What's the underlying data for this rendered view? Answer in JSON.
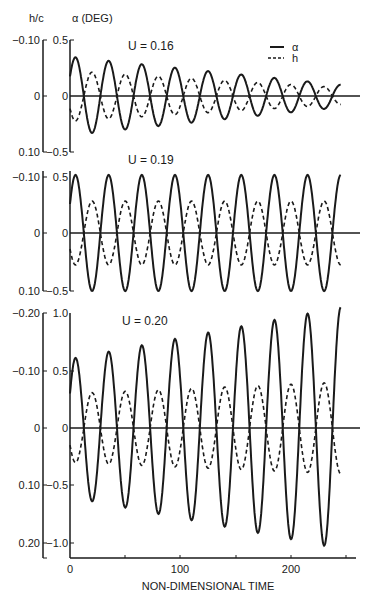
{
  "header": {
    "h_label": "h/c",
    "alpha_label": "α (DEG)"
  },
  "legend": {
    "alpha": "α",
    "h": "h"
  },
  "xaxis": {
    "title": "NON-DIMENSIONAL TIME",
    "ticks": [
      "0",
      "100",
      "200"
    ]
  },
  "panels": [
    {
      "title": "U = 0.16",
      "h_ticks": [
        "−0.10",
        "0",
        "0.10"
      ],
      "alpha_ticks": [
        "0.5",
        "0",
        "−0.5"
      ]
    },
    {
      "title": "U = 0.19",
      "h_ticks": [
        "−0.10",
        "0",
        "0.10"
      ],
      "alpha_ticks": [
        "0.5",
        "0",
        "−0.5"
      ]
    },
    {
      "title": "U = 0.20",
      "h_ticks": [
        "−0.20",
        "−0.10",
        "0",
        "0.10",
        "0.20"
      ],
      "alpha_ticks": [
        "1.0",
        "0.5",
        "0",
        "−0.5",
        "−1.0"
      ]
    }
  ],
  "chart_data": [
    {
      "type": "line",
      "title": "U = 0.16",
      "xlabel": "NON-DIMENSIONAL TIME",
      "ylabel": "α (DEG) / h/c",
      "xlim": [
        0,
        250
      ],
      "ylim_alpha": [
        -0.5,
        0.5
      ],
      "ylim_h": [
        0.1,
        -0.1
      ],
      "description": "Damped oscillation: alpha and h decay",
      "series": [
        {
          "name": "α",
          "style": "solid",
          "period": 30,
          "amplitude_start": 0.35,
          "amplitude_end": 0.1
        },
        {
          "name": "h",
          "style": "dashed",
          "period": 30,
          "amplitude_start": 0.045,
          "amplitude_end": 0.015
        }
      ]
    },
    {
      "type": "line",
      "title": "U = 0.19",
      "xlabel": "NON-DIMENSIONAL TIME",
      "xlim": [
        0,
        250
      ],
      "ylim_alpha": [
        -0.5,
        0.5
      ],
      "ylim_h": [
        0.1,
        -0.1
      ],
      "description": "Neutral stability: constant amplitude",
      "series": [
        {
          "name": "α",
          "style": "solid",
          "period": 30,
          "amplitude_start": 0.5,
          "amplitude_end": 0.5
        },
        {
          "name": "h",
          "style": "dashed",
          "period": 30,
          "amplitude_start": 0.055,
          "amplitude_end": 0.055
        }
      ]
    },
    {
      "type": "line",
      "title": "U = 0.20",
      "xlabel": "NON-DIMENSIONAL TIME",
      "xlim": [
        0,
        250
      ],
      "ylim_alpha": [
        -1.0,
        1.0
      ],
      "ylim_h": [
        0.2,
        -0.2
      ],
      "description": "Flutter: growing oscillation",
      "series": [
        {
          "name": "α",
          "style": "solid",
          "period": 30,
          "amplitude_start": 0.6,
          "amplitude_end": 1.05
        },
        {
          "name": "h",
          "style": "dashed",
          "period": 30,
          "amplitude_start": 0.06,
          "amplitude_end": 0.08
        }
      ]
    }
  ]
}
